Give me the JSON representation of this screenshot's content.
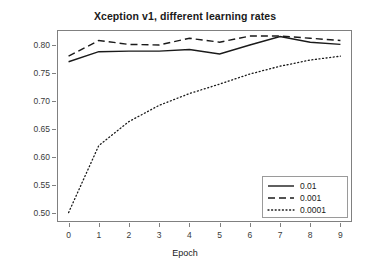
{
  "chart_data": {
    "type": "line",
    "title": "Xception v1, different learning rates",
    "xlabel": "Epoch",
    "ylabel": "Accuracy",
    "x": [
      0,
      1,
      2,
      3,
      4,
      5,
      6,
      7,
      8,
      9
    ],
    "xlim": [
      -0.35,
      9.35
    ],
    "ylim": [
      0.485,
      0.825
    ],
    "xticks": [
      "0",
      "1",
      "2",
      "3",
      "4",
      "5",
      "6",
      "7",
      "8",
      "9"
    ],
    "yticks": [
      "0.50",
      "0.55",
      "0.60",
      "0.65",
      "0.70",
      "0.75",
      "0.80"
    ],
    "ytick_values": [
      0.5,
      0.55,
      0.6,
      0.65,
      0.7,
      0.75,
      0.8
    ],
    "grid": false,
    "legend_position": "bottom-right",
    "series": [
      {
        "name": "0.01",
        "style": "solid",
        "color": "#1a1a1a",
        "values": [
          0.77,
          0.788,
          0.789,
          0.789,
          0.792,
          0.784,
          0.8,
          0.815,
          0.805,
          0.801
        ]
      },
      {
        "name": "0.001",
        "style": "dashed",
        "color": "#1a1a1a",
        "values": [
          0.78,
          0.808,
          0.801,
          0.8,
          0.812,
          0.805,
          0.816,
          0.816,
          0.812,
          0.808
        ]
      },
      {
        "name": "0.0001",
        "style": "dotted",
        "color": "#1a1a1a",
        "values": [
          0.5,
          0.62,
          0.663,
          0.692,
          0.713,
          0.73,
          0.748,
          0.762,
          0.773,
          0.78
        ]
      }
    ]
  },
  "legend": {
    "entries": [
      {
        "label": "0.01"
      },
      {
        "label": "0.001"
      },
      {
        "label": "0.0001"
      }
    ]
  }
}
